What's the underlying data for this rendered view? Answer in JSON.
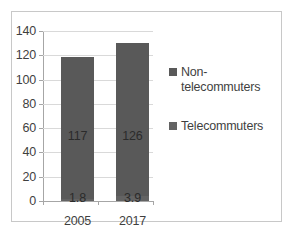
{
  "chart_data": {
    "type": "bar",
    "title": "",
    "xlabel": "",
    "ylabel": "",
    "categories": [
      "2005",
      "2017"
    ],
    "ylim": [
      0,
      140
    ],
    "yticks": [
      "0",
      "20",
      "40",
      "60",
      "80",
      "100",
      "120",
      "140"
    ],
    "grid": true,
    "legend_position": "right",
    "stacked": true,
    "series": [
      {
        "name": "Non-telecommuters",
        "legend_line_1": "Non-",
        "legend_line_2": "telecommuters",
        "color": "#595959",
        "values": [
          117,
          126
        ],
        "labels": [
          "117",
          "126"
        ]
      },
      {
        "name": "Telecommuters",
        "legend_line_1": "Telecommuters",
        "color": "#636363",
        "values": [
          1.8,
          3.9
        ],
        "labels": [
          "1.8",
          "3.9"
        ]
      }
    ]
  },
  "axis": {
    "y_ticks": [
      {
        "label": "140",
        "value": 140
      },
      {
        "label": "120",
        "value": 120
      },
      {
        "label": "100",
        "value": 100
      },
      {
        "label": "80",
        "value": 80
      },
      {
        "label": "60",
        "value": 60
      },
      {
        "label": "40",
        "value": 40
      },
      {
        "label": "20",
        "value": 20
      },
      {
        "label": "0",
        "value": 0
      }
    ]
  },
  "colors": {
    "bar_primary": "#595959",
    "bar_secondary": "#636363",
    "gridline": "#d9d9d9",
    "axis": "#a6a6a6",
    "frame": "#c8c8c8",
    "text": "#3f3f3f",
    "background": "#ffffff"
  }
}
